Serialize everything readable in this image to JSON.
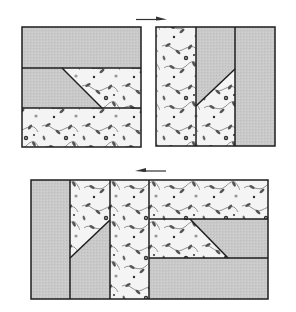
{
  "diagram": {
    "colors": {
      "solid_fabric": "#c9c9c9",
      "floral_bg": "#f4f4f4",
      "floral_leaf": "#555555",
      "floral_flower": "#2e2e2e",
      "outline": "#1e1e1e",
      "arrow": "#333333"
    },
    "arrows": [
      {
        "name": "arrow-right",
        "direction": "right"
      },
      {
        "name": "arrow-left",
        "direction": "left"
      }
    ],
    "blocks": [
      {
        "name": "block-step-1",
        "description": "Square block: solid top strip, middle strip with solid left / floral right diagonal split, floral bottom strip"
      },
      {
        "name": "block-step-2",
        "description": "Square block rotated: floral left column, middle column solid top / floral bottom diagonal split, solid right column"
      },
      {
        "name": "block-combined",
        "description": "Two blocks joined side by side forming a rectangle"
      }
    ]
  }
}
